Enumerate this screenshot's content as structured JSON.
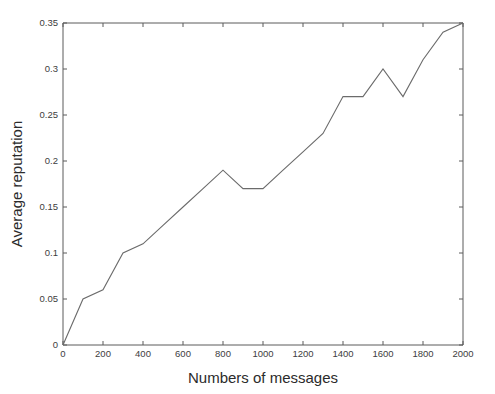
{
  "chart_data": {
    "type": "line",
    "title": "",
    "subtitle": "",
    "xlabel": "Numbers of messages",
    "ylabel": "Average reputation",
    "xlim": [
      0,
      2000
    ],
    "ylim": [
      0,
      0.35
    ],
    "xticks": [
      0,
      200,
      400,
      600,
      800,
      1000,
      1200,
      1400,
      1600,
      1800,
      2000
    ],
    "xticklabels": [
      "0",
      "200",
      "400",
      "600",
      "800",
      "1000",
      "1200",
      "1400",
      "1600",
      "1800",
      "2000"
    ],
    "yticks": [
      0,
      0.05,
      0.1,
      0.15,
      0.2,
      0.25,
      0.3,
      0.35
    ],
    "yticklabels": [
      "0",
      "0.05",
      "0.1",
      "0.15",
      "0.2",
      "0.25",
      "0.3",
      "0.35"
    ],
    "grid": false,
    "legend": null,
    "legend_position": "none",
    "line_color": "#6b6b6b",
    "background_color": "#ffffff",
    "series": [
      {
        "name": "Average reputation",
        "x": [
          0,
          100,
          200,
          300,
          400,
          500,
          600,
          700,
          800,
          900,
          1000,
          1100,
          1200,
          1300,
          1400,
          1500,
          1600,
          1700,
          1800,
          1900,
          2000
        ],
        "values": [
          0.0,
          0.05,
          0.06,
          0.1,
          0.11,
          0.13,
          0.15,
          0.17,
          0.19,
          0.17,
          0.17,
          0.19,
          0.21,
          0.23,
          0.27,
          0.27,
          0.3,
          0.27,
          0.31,
          0.34,
          0.35
        ]
      }
    ]
  }
}
